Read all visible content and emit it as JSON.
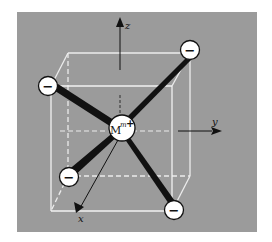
{
  "figure": {
    "background_color": "#9a9a9a",
    "cube_line_color": "#e8e8e8",
    "bond_color": "#111111"
  },
  "axes": {
    "x": {
      "label": "x"
    },
    "y": {
      "label": "y"
    },
    "z": {
      "label": "z"
    }
  },
  "center_ion": {
    "symbol": "M",
    "superscript": "m",
    "charge_sign": "+"
  },
  "ligands": [
    {
      "id": "top-left",
      "sign": "−"
    },
    {
      "id": "top-right",
      "sign": "−"
    },
    {
      "id": "middle-left",
      "sign": "−"
    },
    {
      "id": "bottom-right",
      "sign": "−"
    },
    {
      "id": "bottom-left-back",
      "sign": "−"
    }
  ]
}
